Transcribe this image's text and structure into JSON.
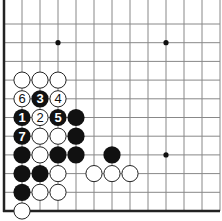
{
  "diagram": {
    "type": "go-board-fragment",
    "board_color": "#ffffff",
    "line_color": "#888888",
    "edge_color": "#222222",
    "edges": [
      "left",
      "bottom"
    ],
    "grid": {
      "origin_x": 4,
      "origin_y": 24,
      "col_spacing": 18,
      "row_spacing": 18.7,
      "cols": 13,
      "rows": 11,
      "right_extent": 220,
      "top_extent": 24
    },
    "star_points": [
      {
        "c": 3,
        "r": 1
      },
      {
        "c": 9,
        "r": 1
      },
      {
        "c": 9,
        "r": 7
      }
    ],
    "stones": [
      {
        "c": 1,
        "r": 3,
        "color": "white",
        "label": ""
      },
      {
        "c": 2,
        "r": 3,
        "color": "white",
        "label": ""
      },
      {
        "c": 3,
        "r": 3,
        "color": "white",
        "label": ""
      },
      {
        "c": 1,
        "r": 4,
        "color": "white",
        "label": "6"
      },
      {
        "c": 2,
        "r": 4,
        "color": "black",
        "label": "3"
      },
      {
        "c": 3,
        "r": 4,
        "color": "white",
        "label": "4"
      },
      {
        "c": 1,
        "r": 5,
        "color": "black",
        "label": "1"
      },
      {
        "c": 2,
        "r": 5,
        "color": "white",
        "label": "2"
      },
      {
        "c": 3,
        "r": 5,
        "color": "black",
        "label": "5"
      },
      {
        "c": 4,
        "r": 5,
        "color": "black",
        "label": ""
      },
      {
        "c": 1,
        "r": 6,
        "color": "black",
        "label": "7"
      },
      {
        "c": 2,
        "r": 6,
        "color": "white",
        "label": ""
      },
      {
        "c": 3,
        "r": 6,
        "color": "white",
        "label": ""
      },
      {
        "c": 4,
        "r": 6,
        "color": "black",
        "label": ""
      },
      {
        "c": 1,
        "r": 7,
        "color": "black",
        "label": ""
      },
      {
        "c": 2,
        "r": 7,
        "color": "white",
        "label": ""
      },
      {
        "c": 3,
        "r": 7,
        "color": "black",
        "label": ""
      },
      {
        "c": 4,
        "r": 7,
        "color": "black",
        "label": ""
      },
      {
        "c": 6,
        "r": 7,
        "color": "black",
        "label": ""
      },
      {
        "c": 1,
        "r": 8,
        "color": "black",
        "label": ""
      },
      {
        "c": 2,
        "r": 8,
        "color": "black",
        "label": ""
      },
      {
        "c": 3,
        "r": 8,
        "color": "white",
        "label": ""
      },
      {
        "c": 5,
        "r": 8,
        "color": "white",
        "label": ""
      },
      {
        "c": 6,
        "r": 8,
        "color": "white",
        "label": ""
      },
      {
        "c": 7,
        "r": 8,
        "color": "white",
        "label": ""
      },
      {
        "c": 1,
        "r": 9,
        "color": "black",
        "label": ""
      },
      {
        "c": 2,
        "r": 9,
        "color": "white",
        "label": ""
      },
      {
        "c": 3,
        "r": 9,
        "color": "white",
        "label": ""
      },
      {
        "c": 1,
        "r": 10,
        "color": "white",
        "label": ""
      }
    ],
    "stone_radius": 8.6,
    "black_stone_color": "#111111",
    "white_stone_fill": "#ffffff",
    "white_stone_stroke": "#222222",
    "label_on_black_color": "#ffffff",
    "label_on_white_color": "#111111"
  }
}
